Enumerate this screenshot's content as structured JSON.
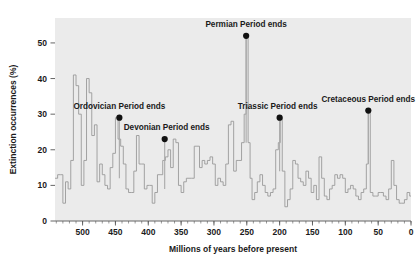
{
  "chart_data": {
    "type": "line",
    "title": "",
    "subtitle": "",
    "xlabel": "Millions of years before present",
    "ylabel": "Extinction occurrences (%)",
    "xlim": [
      542,
      0
    ],
    "ylim": [
      0,
      57
    ],
    "x_reversed": true,
    "grid": false,
    "legend": "none",
    "xticks": [
      500,
      450,
      400,
      350,
      300,
      250,
      200,
      150,
      100,
      50,
      0
    ],
    "xtick_labels": [
      "500",
      "450",
      "400",
      "350",
      "300",
      "250",
      "200",
      "150",
      "100",
      "50",
      "0"
    ],
    "x_minor_tick_step": 10,
    "yticks": [
      0,
      10,
      20,
      30,
      40,
      50
    ],
    "ytick_labels": [
      "0",
      "10",
      "20",
      "30",
      "40",
      "50"
    ],
    "plot_background": "#ebebeb",
    "line_color": "#9a9a9a",
    "marker_color": "#111111",
    "axis_color": "#555555",
    "series": [
      {
        "name": "Extinction intensity",
        "step": "post",
        "x": [
          542,
          538,
          534,
          530,
          526,
          522,
          518,
          514,
          510,
          506,
          502,
          498,
          494,
          490,
          486,
          482,
          478,
          474,
          470,
          466,
          462,
          458,
          454,
          450,
          446,
          442,
          438,
          434,
          430,
          426,
          422,
          418,
          414,
          410,
          406,
          402,
          398,
          394,
          390,
          386,
          382,
          378,
          374,
          370,
          366,
          362,
          358,
          354,
          350,
          346,
          342,
          338,
          334,
          330,
          326,
          322,
          318,
          314,
          310,
          306,
          302,
          298,
          294,
          290,
          286,
          282,
          278,
          274,
          270,
          266,
          262,
          258,
          254,
          251,
          248,
          245,
          242,
          238,
          234,
          230,
          226,
          222,
          218,
          214,
          210,
          206,
          202,
          199,
          196,
          192,
          188,
          184,
          180,
          176,
          172,
          168,
          164,
          160,
          156,
          152,
          148,
          144,
          140,
          136,
          132,
          128,
          124,
          120,
          116,
          112,
          108,
          104,
          100,
          96,
          92,
          88,
          84,
          80,
          76,
          72,
          68,
          65,
          62,
          58,
          54,
          50,
          46,
          42,
          38,
          34,
          30,
          26,
          22,
          18,
          14,
          10,
          6,
          2,
          0
        ],
        "y": [
          12,
          13,
          13,
          5,
          11,
          9,
          17,
          41,
          38,
          30,
          10,
          17,
          40,
          36,
          24,
          27,
          11,
          16,
          13,
          10,
          9,
          15,
          19,
          29,
          23,
          21,
          16,
          9,
          8,
          8,
          14,
          24,
          16,
          16,
          9,
          10,
          10,
          5,
          8,
          13,
          13,
          17,
          18,
          20,
          15,
          23,
          22,
          10,
          8,
          11,
          12,
          12,
          12,
          21,
          21,
          15,
          17,
          16,
          17,
          18,
          16,
          10,
          12,
          11,
          10,
          16,
          27,
          28,
          14,
          17,
          17,
          22,
          30,
          52,
          22,
          12,
          6,
          8,
          11,
          13,
          10,
          8,
          7,
          8,
          9,
          20,
          22,
          29,
          14,
          4,
          6,
          9,
          17,
          16,
          12,
          11,
          10,
          14,
          12,
          8,
          10,
          6,
          18,
          12,
          7,
          6,
          9,
          10,
          13,
          12,
          13,
          12,
          8,
          9,
          10,
          9,
          7,
          6,
          8,
          9,
          16,
          31,
          8,
          7,
          7,
          8,
          8,
          7,
          6,
          9,
          17,
          10,
          6,
          5,
          5,
          6,
          8,
          7,
          7
        ]
      }
    ],
    "annotations": [
      {
        "label": "Ordovician Period ends",
        "x": 444,
        "y": 29,
        "dot_x": 444,
        "dot_y": 29,
        "text_anchor": "middle",
        "text_dx": 0,
        "text_dy": -9,
        "stem_to_y": 12
      },
      {
        "label": "Devonian Period ends",
        "x": 375,
        "y": 23,
        "dot_x": 375,
        "dot_y": 23,
        "text_anchor": "middle",
        "text_dx": 2,
        "text_dy": -9,
        "stem_to_y": 9
      },
      {
        "label": "Permian Period ends",
        "x": 251,
        "y": 52,
        "dot_x": 251,
        "dot_y": 52,
        "text_anchor": "middle",
        "text_dx": 0,
        "text_dy": -9,
        "stem_to_y": 22
      },
      {
        "label": "Triassic Period ends",
        "x": 200,
        "y": 29,
        "dot_x": 200,
        "dot_y": 29,
        "text_anchor": "middle",
        "text_dx": -2,
        "text_dy": -9,
        "stem_to_y": 14
      },
      {
        "label": "Cretaceous Period ends",
        "x": 65,
        "y": 31,
        "dot_x": 65,
        "dot_y": 31,
        "text_anchor": "middle",
        "text_dx": 0,
        "text_dy": -9,
        "stem_to_y": 16
      }
    ]
  }
}
